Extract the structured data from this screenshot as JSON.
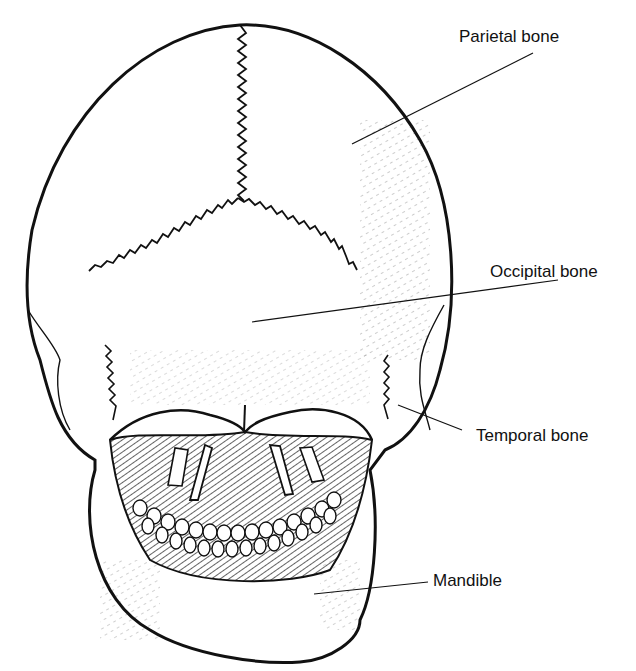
{
  "figure": {
    "stroke_color": "#111111",
    "background": "#ffffff"
  },
  "labels": [
    {
      "id": "parietal",
      "text": "Parietal bone",
      "x": 459,
      "y": 28,
      "line": [
        [
          533,
          53
        ],
        [
          352,
          144
        ]
      ]
    },
    {
      "id": "occipital",
      "text": "Occipital bone",
      "x": 490,
      "y": 263,
      "line": [
        [
          558,
          280
        ],
        [
          252,
          322
        ]
      ]
    },
    {
      "id": "temporal",
      "text": "Temporal bone",
      "x": 476,
      "y": 427,
      "line": [
        [
          462,
          430
        ],
        [
          398,
          405
        ]
      ]
    },
    {
      "id": "mandible",
      "text": "Mandible",
      "x": 433,
      "y": 572,
      "line": [
        [
          428,
          582
        ],
        [
          314,
          594
        ]
      ]
    }
  ]
}
